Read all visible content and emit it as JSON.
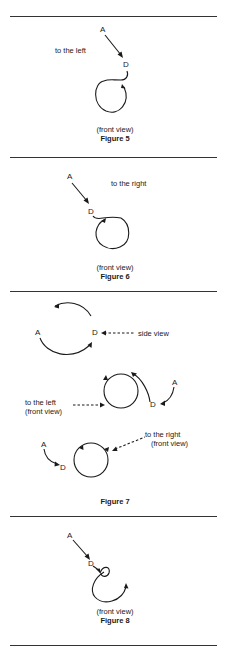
{
  "figures": [
    {
      "id": "figure-5",
      "caption": "(front view)",
      "title": "Figure 5",
      "direction_label": "to the left",
      "point_a": "A",
      "point_d": "D"
    },
    {
      "id": "figure-6",
      "caption": "(front view)",
      "title": "Figure 6",
      "direction_label": "to the right",
      "point_a": "A",
      "point_d": "D"
    },
    {
      "id": "figure-7",
      "title": "Figure 7",
      "side": {
        "point_a": "A",
        "point_d": "D",
        "label": "side view"
      },
      "left": {
        "point_a": "A",
        "point_d": "D",
        "label_line1": "to the left",
        "label_line2": "(front view)"
      },
      "right": {
        "point_a": "A",
        "point_d": "D",
        "label_line1": "to the right",
        "label_line2": "(front view)"
      }
    },
    {
      "id": "figure-8",
      "caption": "(front view)",
      "title": "Figure 8",
      "point_a": "A",
      "point_d": "D"
    }
  ]
}
